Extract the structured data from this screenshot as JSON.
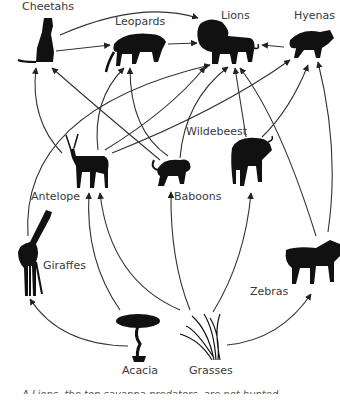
{
  "diagram": {
    "type": "food-web",
    "nodes": {
      "cheetahs": "Cheetahs",
      "leopards": "Leopards",
      "lions": "Lions",
      "hyenas": "Hyenas",
      "antelope": "Antelope",
      "baboons": "Baboons",
      "wildebeest": "Wildebeest",
      "giraffes": "Giraffes",
      "zebras": "Zebras",
      "acacia": "Acacia",
      "grasses": "Grasses"
    },
    "edges": [
      {
        "from": "Cheetahs",
        "to": "Leopards"
      },
      {
        "from": "Cheetahs",
        "to": "Lions"
      },
      {
        "from": "Leopards",
        "to": "Lions"
      },
      {
        "from": "Hyenas",
        "to": "Lions"
      },
      {
        "from": "Antelope",
        "to": "Cheetahs"
      },
      {
        "from": "Antelope",
        "to": "Leopards"
      },
      {
        "from": "Antelope",
        "to": "Lions"
      },
      {
        "from": "Antelope",
        "to": "Hyenas"
      },
      {
        "from": "Baboons",
        "to": "Cheetahs"
      },
      {
        "from": "Baboons",
        "to": "Leopards"
      },
      {
        "from": "Baboons",
        "to": "Lions"
      },
      {
        "from": "Wildebeest",
        "to": "Lions"
      },
      {
        "from": "Wildebeest",
        "to": "Hyenas"
      },
      {
        "from": "Giraffes",
        "to": "Lions"
      },
      {
        "from": "Zebras",
        "to": "Lions"
      },
      {
        "from": "Zebras",
        "to": "Hyenas"
      },
      {
        "from": "Acacia",
        "to": "Giraffes"
      },
      {
        "from": "Acacia",
        "to": "Antelope"
      },
      {
        "from": "Grasses",
        "to": "Antelope"
      },
      {
        "from": "Grasses",
        "to": "Baboons"
      },
      {
        "from": "Grasses",
        "to": "Wildebeest"
      },
      {
        "from": "Grasses",
        "to": "Zebras"
      }
    ],
    "caption": "A  Lions, the top savanna predators, are not hunted..."
  }
}
